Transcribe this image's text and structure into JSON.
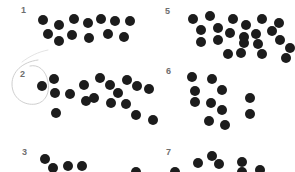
{
  "page": {
    "background": "#ffffff",
    "dot_color": "#1c1c1c",
    "label_color": "#6e6e6e",
    "dot_diameter": 10
  },
  "panels": [
    {
      "label": "1",
      "label_pos": [
        21,
        6
      ],
      "dots": [
        [
          43,
          20
        ],
        [
          59,
          25
        ],
        [
          74,
          19
        ],
        [
          88,
          23
        ],
        [
          101,
          19
        ],
        [
          115,
          21
        ],
        [
          130,
          21
        ],
        [
          48,
          34
        ],
        [
          59,
          41
        ],
        [
          72,
          35
        ],
        [
          89,
          38
        ],
        [
          108,
          34
        ],
        [
          124,
          37
        ]
      ]
    },
    {
      "label": "5",
      "label_pos": [
        165,
        7
      ],
      "dots": [
        [
          193,
          19
        ],
        [
          210,
          16
        ],
        [
          233,
          19
        ],
        [
          246,
          25
        ],
        [
          262,
          19
        ],
        [
          279,
          23
        ],
        [
          201,
          30
        ],
        [
          218,
          28
        ],
        [
          230,
          33
        ],
        [
          244,
          37
        ],
        [
          256,
          34
        ],
        [
          272,
          31
        ],
        [
          201,
          42
        ],
        [
          218,
          40
        ],
        [
          244,
          43
        ],
        [
          258,
          44
        ],
        [
          280,
          40
        ],
        [
          228,
          54
        ],
        [
          241,
          53
        ],
        [
          262,
          54
        ],
        [
          286,
          58
        ],
        [
          290,
          48
        ]
      ]
    },
    {
      "label": "2",
      "label_pos": [
        20,
        70
      ],
      "dots": [
        [
          42,
          86
        ],
        [
          54,
          79
        ],
        [
          55,
          93
        ],
        [
          70,
          94
        ],
        [
          84,
          85
        ],
        [
          86,
          101
        ],
        [
          94,
          98
        ],
        [
          110,
          85
        ],
        [
          100,
          78
        ],
        [
          111,
          103
        ],
        [
          118,
          93
        ],
        [
          127,
          80
        ],
        [
          126,
          104
        ],
        [
          137,
          86
        ],
        [
          149,
          89
        ],
        [
          136,
          115
        ],
        [
          153,
          120
        ],
        [
          56,
          113
        ]
      ]
    },
    {
      "label": "6",
      "label_pos": [
        166,
        67
      ],
      "dots": [
        [
          192,
          77
        ],
        [
          212,
          79
        ],
        [
          195,
          91
        ],
        [
          222,
          90
        ],
        [
          250,
          98
        ],
        [
          195,
          102
        ],
        [
          211,
          103
        ],
        [
          222,
          110
        ],
        [
          250,
          114
        ],
        [
          209,
          121
        ],
        [
          225,
          125
        ]
      ]
    },
    {
      "label": "3",
      "label_pos": [
        22,
        148
      ],
      "dots": [
        [
          45,
          159
        ],
        [
          53,
          168
        ],
        [
          68,
          166
        ],
        [
          82,
          166
        ],
        [
          136,
          172
        ]
      ]
    },
    {
      "label": "7",
      "label_pos": [
        166,
        148
      ],
      "dots": [
        [
          198,
          163
        ],
        [
          212,
          156
        ],
        [
          219,
          164
        ],
        [
          242,
          162
        ],
        [
          242,
          172
        ],
        [
          260,
          170
        ],
        [
          175,
          172
        ]
      ]
    }
  ],
  "annotations": [
    {
      "type": "hand-drawn-circle",
      "around_label": "2",
      "stroke": "#c8c8c8"
    }
  ]
}
